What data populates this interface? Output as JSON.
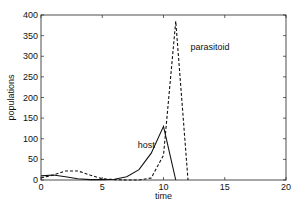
{
  "chart_data": {
    "type": "line",
    "title": "",
    "xlabel": "time",
    "ylabel": "populations",
    "xlim": [
      0,
      20
    ],
    "ylim": [
      0,
      400
    ],
    "xticks": [
      0,
      5,
      10,
      15,
      20
    ],
    "yticks": [
      0,
      50,
      100,
      150,
      200,
      250,
      300,
      350,
      400
    ],
    "grid": false,
    "legend": "none (inline annotations)",
    "series": [
      {
        "name": "host",
        "style": "solid",
        "x": [
          0,
          1,
          2,
          3,
          4,
          5,
          6,
          7,
          8,
          9,
          10,
          11
        ],
        "y": [
          10,
          12,
          8,
          3,
          1,
          1,
          2,
          8,
          25,
          65,
          130,
          0
        ]
      },
      {
        "name": "parasitoid",
        "style": "dashed",
        "x": [
          0,
          1,
          2,
          3,
          4,
          5,
          6,
          7,
          8,
          9,
          10,
          11,
          12
        ],
        "y": [
          5,
          12,
          22,
          22,
          12,
          3,
          1,
          0,
          0,
          5,
          60,
          385,
          0
        ]
      }
    ],
    "annotations": [
      {
        "text": "host",
        "x": 7.9,
        "y": 78
      },
      {
        "text": "parasitoid",
        "x": 12.2,
        "y": 315
      }
    ]
  },
  "labels": {
    "x_axis": "time",
    "y_axis": "populations",
    "host": "host",
    "parasitoid": "parasitoid"
  }
}
